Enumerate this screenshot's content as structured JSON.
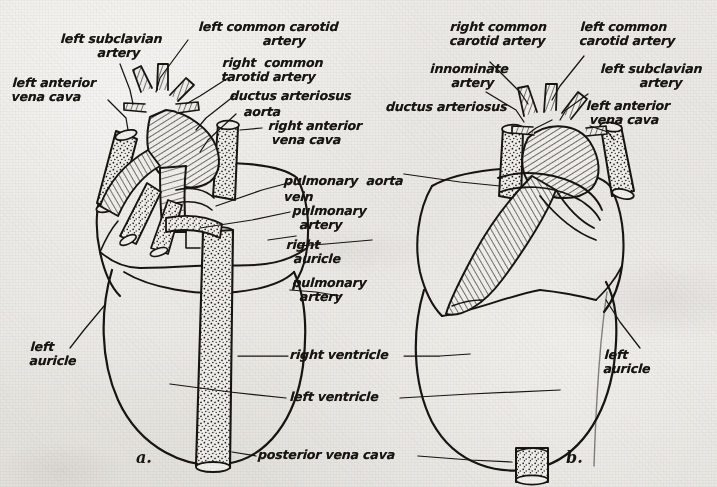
{
  "figure": {
    "kind": "anatomical-line-drawing",
    "panels": [
      {
        "id": "a",
        "caption": "a.",
        "view": "ventral"
      },
      {
        "id": "b",
        "caption": "b.",
        "view": "dorsal"
      }
    ]
  },
  "labels": {
    "panel_a": [
      {
        "name": "left-subclavian-artery",
        "text": "left subclavian\n    artery"
      },
      {
        "name": "left-common-carotid-artery",
        "text": "left common carotid\n        artery"
      },
      {
        "name": "left-anterior-vena-cava",
        "text": "left anterior\nvena cava"
      },
      {
        "name": "right-common-carotid-artery",
        "text": "right  common\ntarotid artery"
      },
      {
        "name": "ductus-arteriosus",
        "text": "ductus arteriosus"
      },
      {
        "name": "aorta",
        "text": "aorta"
      },
      {
        "name": "right-anterior-vena-cava",
        "text": "right anterior\n vena cava"
      },
      {
        "name": "left-auricle",
        "text": "left\nauricle"
      }
    ],
    "center": [
      {
        "name": "pulmonary-aorta",
        "text": "pulmonary  aorta"
      },
      {
        "name": "pulmonary-vein",
        "text": "vein"
      },
      {
        "name": "pulmonary-artery-upper",
        "text": "pulmonary\n  artery"
      },
      {
        "name": "right-auricle",
        "text": "right\n  auricle"
      },
      {
        "name": "pulmonary-artery-lower",
        "text": "pulmonary\n  artery"
      },
      {
        "name": "right-ventricle",
        "text": "right ventricle"
      },
      {
        "name": "left-ventricle",
        "text": "left ventricle"
      },
      {
        "name": "posterior-vena-cava",
        "text": "posterior vena cava"
      }
    ],
    "panel_b": [
      {
        "name": "right-common-carotid-artery",
        "text": "right common\ncarotid artery"
      },
      {
        "name": "left-common-carotid-artery",
        "text": "left common\ncarotid artery"
      },
      {
        "name": "innominate-artery",
        "text": "innominate\n  artery"
      },
      {
        "name": "left-subclavian-artery",
        "text": "left subclavian\n     artery"
      },
      {
        "name": "ductus-arteriosus",
        "text": "ductus arteriosus"
      },
      {
        "name": "left-anterior-vena-cava",
        "text": "left anterior\n vena cava"
      },
      {
        "name": "left-auricle",
        "text": "left\nauricle"
      }
    ]
  },
  "colors": {
    "ink": "#17150f",
    "paper": "#e9e7e2"
  }
}
